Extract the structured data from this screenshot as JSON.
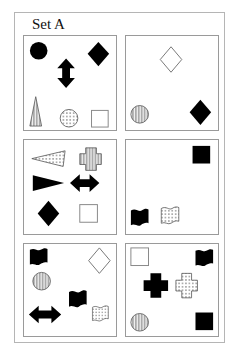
{
  "title": "Set A",
  "colors": {
    "ink": "#000000",
    "frame": "#b5b5b5",
    "panel_border": "#9a9a9a",
    "hollow_stroke": "#777777"
  },
  "panels": [
    {
      "id": 1,
      "shapes": [
        "black circle",
        "black vertical double arrow",
        "black diamond",
        "vertically striped triangle",
        "dotted circle",
        "hollow square"
      ]
    },
    {
      "id": 2,
      "shapes": [
        "hollow diamond",
        "vertically striped circle",
        "black diamond"
      ]
    },
    {
      "id": 3,
      "shapes": [
        "dotted horizontal triangle",
        "vertically striped cross",
        "black horizontal triangle",
        "black horizontal double arrow",
        "black diamond",
        "hollow square"
      ]
    },
    {
      "id": 4,
      "shapes": [
        "black square",
        "black wave flag",
        "dotted wave flag"
      ]
    },
    {
      "id": 5,
      "shapes": [
        "black wave flag",
        "hollow diamond",
        "vertically striped circle",
        "black wave flag",
        "black horizontal double arrow",
        "dotted wave flag"
      ]
    },
    {
      "id": 6,
      "shapes": [
        "hollow square",
        "black wave flag",
        "black cross",
        "dotted cross",
        "vertically striped circle",
        "black square"
      ]
    }
  ]
}
